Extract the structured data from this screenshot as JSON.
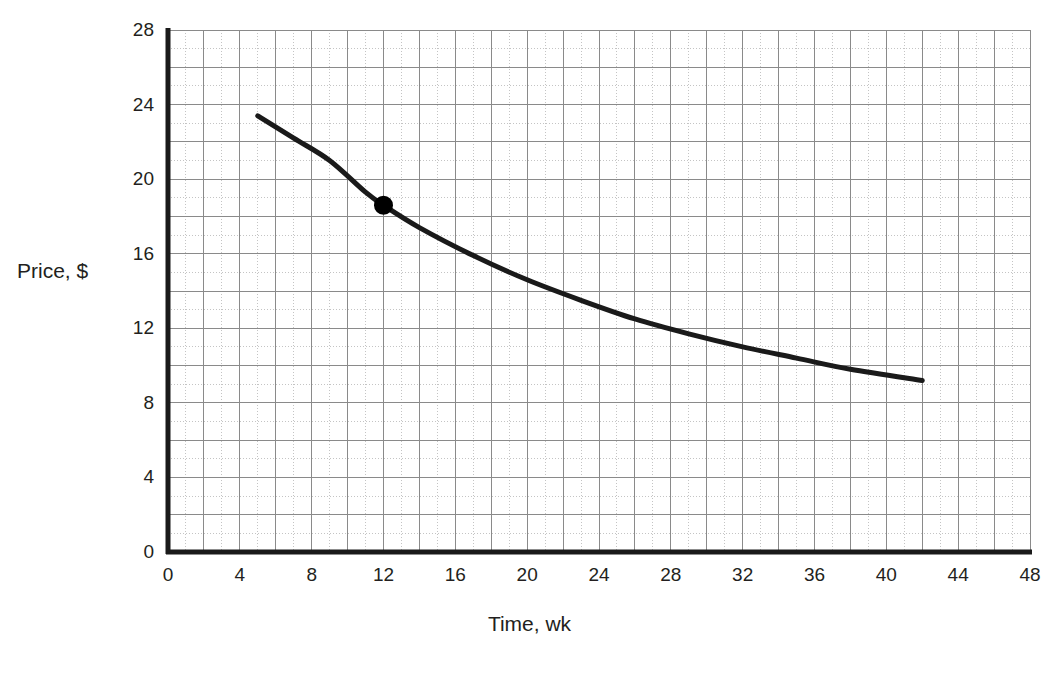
{
  "chart_data": {
    "type": "line",
    "title": "",
    "subtitle": "",
    "xlabel": "Time, wk",
    "ylabel": "Price, $",
    "xlim": [
      0,
      48
    ],
    "ylim": [
      0,
      28
    ],
    "xticks": [
      0,
      4,
      8,
      12,
      16,
      20,
      24,
      28,
      32,
      36,
      40,
      44,
      48
    ],
    "yticks": [
      0,
      4,
      8,
      12,
      16,
      20,
      24,
      28
    ],
    "xtick_labels": [
      "0",
      "4",
      "8",
      "12",
      "16",
      "20",
      "24",
      "28",
      "32",
      "36",
      "40",
      "44",
      "48"
    ],
    "ytick_labels": [
      "0",
      "4",
      "8",
      "12",
      "16",
      "20",
      "24",
      "28"
    ],
    "grid": {
      "major_enabled": true,
      "minor_enabled": true,
      "major_step_x": 2,
      "major_step_y": 2,
      "minor_step_x": 1,
      "minor_step_y": 1,
      "major_color": "#8a8a8a",
      "minor_color": "#c4c4c4"
    },
    "legend": {
      "visible": false,
      "position": "none"
    },
    "axis_color": "#1a1a1a",
    "series": [
      {
        "name": "Price",
        "kind": "curve",
        "color": "#1a1a1a",
        "line_width": 5,
        "x": [
          5,
          7,
          9,
          11,
          12,
          14,
          17,
          20,
          23,
          26,
          29,
          32,
          35,
          38,
          42
        ],
        "y": [
          23.4,
          22.2,
          21.0,
          19.3,
          18.6,
          17.4,
          15.9,
          14.6,
          13.5,
          12.5,
          11.7,
          11.0,
          10.4,
          9.8,
          9.2
        ]
      }
    ],
    "markers": [
      {
        "name": "highlighted-point",
        "x": 12,
        "y": 18.6,
        "shape": "circle",
        "color": "#000000",
        "radius": 9.5
      }
    ]
  },
  "geometry": {
    "plot_left": 168,
    "plot_right": 1030,
    "plot_top": 30,
    "plot_bottom": 552
  }
}
